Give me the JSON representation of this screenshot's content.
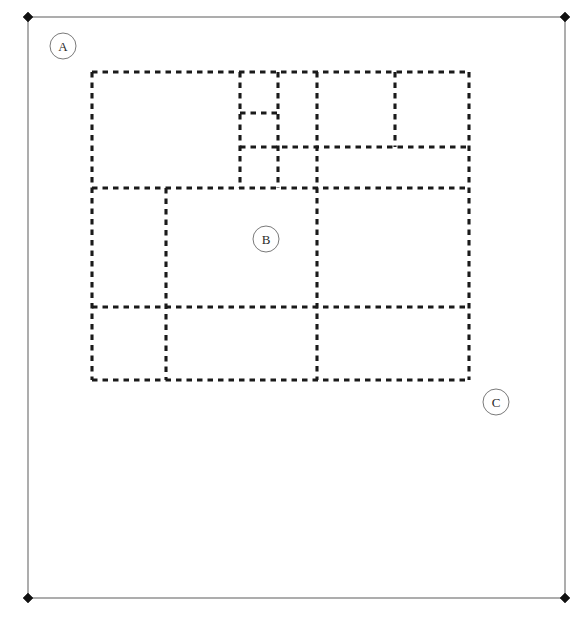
{
  "diagram": {
    "width": 580,
    "height": 618,
    "background_color": "#ffffff"
  },
  "outer_frame": {
    "name": "bounding-frame",
    "x1": 28,
    "y1": 17,
    "x2": 565,
    "y2": 598,
    "stroke_color": "#6b6b6b",
    "stroke_width": 1.1,
    "style": "solid"
  },
  "corner_markers": {
    "shape": "filled-diamond",
    "color": "#111111",
    "radius": 5,
    "points": [
      {
        "label": "top-left",
        "x": 28,
        "y": 17
      },
      {
        "label": "top-right",
        "x": 565,
        "y": 17
      },
      {
        "label": "bottom-left",
        "x": 28,
        "y": 598
      },
      {
        "label": "bottom-right",
        "x": 565,
        "y": 598
      }
    ]
  },
  "dashed_grid": {
    "name": "partition-grid",
    "stroke_color": "#1a1a1a",
    "stroke_width": 3.1,
    "dash_pattern": "5.5 5.0",
    "bounds": {
      "left": 92,
      "top": 72,
      "right": 469,
      "bottom": 380
    },
    "vertical_lines": [
      {
        "id": "v-outer-left",
        "x": 92,
        "y1": 72,
        "y2": 380
      },
      {
        "id": "v-lower-left",
        "x": 166,
        "y1": 188,
        "y2": 380
      },
      {
        "id": "v-small-a",
        "x": 240,
        "y1": 72,
        "y2": 188
      },
      {
        "id": "v-small-b",
        "x": 278,
        "y1": 72,
        "y2": 188
      },
      {
        "id": "v-center",
        "x": 317,
        "y1": 72,
        "y2": 380
      },
      {
        "id": "v-upper-right",
        "x": 395,
        "y1": 72,
        "y2": 147
      },
      {
        "id": "v-outer-right",
        "x": 469,
        "y1": 72,
        "y2": 380
      }
    ],
    "horizontal_lines": [
      {
        "id": "h-top",
        "y": 72,
        "x1": 92,
        "x2": 469
      },
      {
        "id": "h-small-split",
        "y": 113,
        "x1": 240,
        "x2": 278
      },
      {
        "id": "h-upper-mid",
        "y": 147,
        "x1": 240,
        "x2": 469
      },
      {
        "id": "h-band",
        "y": 188,
        "x1": 92,
        "x2": 469
      },
      {
        "id": "h-lower-mid",
        "y": 307,
        "x1": 92,
        "x2": 469
      },
      {
        "id": "h-bottom",
        "y": 380,
        "x1": 92,
        "x2": 469
      }
    ]
  },
  "labels": [
    {
      "id": "label-a",
      "text": "A",
      "cx": 63,
      "cy": 46,
      "r": 13
    },
    {
      "id": "label-b",
      "text": "B",
      "cx": 266,
      "cy": 239,
      "r": 13
    },
    {
      "id": "label-c",
      "text": "C",
      "cx": 496,
      "cy": 402,
      "r": 13
    }
  ]
}
